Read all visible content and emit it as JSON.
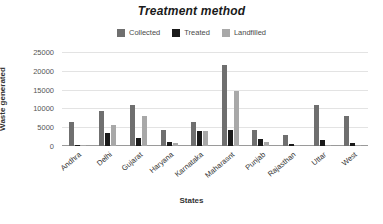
{
  "chart_data": {
    "type": "bar",
    "title": "Treatment method",
    "xlabel": "States",
    "ylabel": "Waste generated",
    "ylim": [
      0,
      25000
    ],
    "yticks": [
      25000,
      20000,
      15000,
      10000,
      5000,
      0
    ],
    "grid": true,
    "legend_position": "top-center",
    "categories": [
      "Andhra",
      "Delhi",
      "Gujarat",
      "Haryana",
      "Karnataka",
      "Maharasnt",
      "Punjab",
      "Rajasthan",
      "Uttar",
      "West"
    ],
    "series": [
      {
        "name": "Collected",
        "color": "#6f6f6f",
        "values": [
          6400,
          9200,
          11000,
          4300,
          6300,
          21500,
          4300,
          2800,
          11000,
          8000
        ]
      },
      {
        "name": "Treated",
        "color": "#1a1a1a",
        "values": [
          300,
          3400,
          2000,
          1200,
          4100,
          4200,
          1800,
          500,
          1600,
          700
        ]
      },
      {
        "name": "Landfilled",
        "color": "#a8a8a8",
        "values": [
          150,
          5500,
          8000,
          800,
          4000,
          14500,
          1200,
          150,
          150,
          150
        ]
      }
    ]
  }
}
